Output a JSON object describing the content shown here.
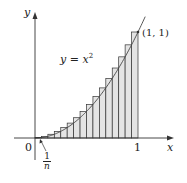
{
  "chart_data": {
    "type": "area",
    "title": "",
    "function": "y = x^2",
    "n_rectangles": 16,
    "rectangle_rule": "right-endpoint",
    "x": [
      0.0625,
      0.125,
      0.1875,
      0.25,
      0.3125,
      0.375,
      0.4375,
      0.5,
      0.5625,
      0.625,
      0.6875,
      0.75,
      0.8125,
      0.875,
      0.9375,
      1.0
    ],
    "values": [
      0.0039,
      0.0156,
      0.0352,
      0.0625,
      0.0977,
      0.1406,
      0.1914,
      0.25,
      0.3164,
      0.3906,
      0.4727,
      0.5625,
      0.6602,
      0.7656,
      0.8789,
      1.0
    ],
    "xlabel": "x",
    "ylabel": "y",
    "xlim": [
      0,
      1
    ],
    "ylim": [
      0,
      1
    ],
    "annotations": [
      "y = x²",
      "(1, 1)",
      "0",
      "1",
      "1/n"
    ],
    "grid": false,
    "fill_color": "#e4e4e4",
    "stroke_color": "#333333"
  },
  "labels": {
    "y_axis": "y",
    "x_axis": "x",
    "origin": "0",
    "x_one": "1",
    "point": "(1, 1)",
    "curve_base": "y = x",
    "curve_exp": "2",
    "frac_num": "1",
    "frac_den": "n"
  }
}
